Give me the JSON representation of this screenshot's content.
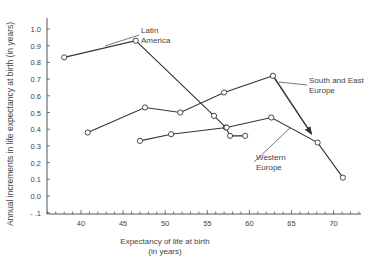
{
  "chart_data": {
    "type": "line",
    "title": "",
    "xlabel": "Expectancy of life at birth (in years)",
    "xlabel_lines": [
      "Expectancy of life at birth",
      "(in years)"
    ],
    "ylabel": "Annual increments in life expectancy at birth (in years)",
    "xlim": [
      35,
      73
    ],
    "ylim": [
      -0.1,
      1.05
    ],
    "x_ticks": [
      40,
      45,
      50,
      55,
      60,
      65,
      70
    ],
    "y_ticks": [
      -0.1,
      0.0,
      0.1,
      0.2,
      0.3,
      0.4,
      0.5,
      0.6,
      0.7,
      0.8,
      0.9,
      1.0
    ],
    "y_tick_labels": [
      "- .1",
      "0.0",
      "0.1",
      "0.2",
      "0.3",
      "0.4",
      "0.5",
      "0.6",
      "0.7",
      "0.8",
      "0.9",
      "1.0"
    ],
    "grid": false,
    "legend": "inline annotations",
    "series": [
      {
        "name": "Latin America",
        "x": [
          38.0,
          46.5,
          55.8,
          57.2,
          57.7,
          59.5
        ],
        "y": [
          0.83,
          0.93,
          0.48,
          0.41,
          0.36,
          0.36
        ]
      },
      {
        "name": "South and East Europe",
        "x": [
          40.8,
          47.6,
          51.8,
          57.0,
          62.8
        ],
        "y": [
          0.38,
          0.53,
          0.5,
          0.62,
          0.72
        ],
        "arrow_to": {
          "x": 67.4,
          "y": 0.37
        }
      },
      {
        "name": "Western Europe",
        "x": [
          47.0,
          50.7,
          57.3,
          62.6,
          68.1,
          71.1
        ],
        "y": [
          0.33,
          0.37,
          0.41,
          0.47,
          0.32,
          0.11
        ]
      }
    ],
    "annotations": [
      {
        "text": [
          "Latin",
          "America"
        ],
        "x": 141,
        "y": 33,
        "pointer_to": [
          105,
          46
        ]
      },
      {
        "text": [
          "South and East",
          "Europe"
        ],
        "x": 309,
        "y": 83,
        "pointer_to": [
          279,
          82
        ]
      },
      {
        "text": [
          "Western",
          "Europe"
        ],
        "x": 256,
        "y": 160,
        "pointer_to": [
          290,
          128
        ]
      }
    ]
  }
}
